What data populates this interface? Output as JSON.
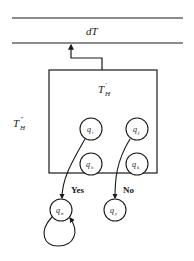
{
  "diagram": {
    "tape": {
      "label": "dT"
    },
    "outer_machine": {
      "label_main": "T",
      "label_sup": "″",
      "label_sub": "H"
    },
    "inner_machine": {
      "label_main": "T",
      "label_sup": "′",
      "label_sub": "H"
    },
    "states": [
      {
        "id": "qi",
        "main": "q",
        "sub": "i"
      },
      {
        "id": "qj",
        "main": "q",
        "sub": "j"
      },
      {
        "id": "qh",
        "main": "q",
        "sub": "h"
      },
      {
        "id": "qk",
        "main": "q",
        "sub": "k"
      },
      {
        "id": "qn",
        "main": "q",
        "sub": "n"
      },
      {
        "id": "qy",
        "main": "q",
        "sub": "y"
      }
    ],
    "branches": {
      "yes": "Yes",
      "no": "No"
    },
    "colors": {
      "stroke": "#1a1a1a",
      "background": "#ffffff"
    }
  }
}
